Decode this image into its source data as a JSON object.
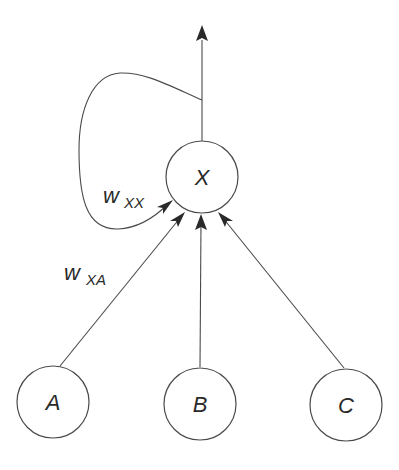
{
  "diagram": {
    "title": "",
    "nodes": [
      {
        "id": "X",
        "label": "X",
        "role": "output"
      },
      {
        "id": "A",
        "label": "A",
        "role": "input"
      },
      {
        "id": "B",
        "label": "B",
        "role": "input"
      },
      {
        "id": "C",
        "label": "C",
        "role": "input"
      }
    ],
    "edges": [
      {
        "from": "A",
        "to": "X",
        "label": "w_XA"
      },
      {
        "from": "B",
        "to": "X",
        "label": ""
      },
      {
        "from": "C",
        "to": "X",
        "label": ""
      },
      {
        "from": "X",
        "to": "X",
        "label": "w_XX",
        "type": "recurrent-loop"
      },
      {
        "from": "X",
        "to": "output",
        "label": ""
      }
    ],
    "labels": {
      "node_x": "X",
      "node_a": "A",
      "node_b": "B",
      "node_c": "C",
      "weight_xx_main": "w",
      "weight_xx_sub": "XX",
      "weight_xa_main": "w",
      "weight_xa_sub": "XA"
    },
    "colors": {
      "stroke": "#4a4a4a",
      "text": "#2a2a2a",
      "background": "#ffffff"
    }
  }
}
